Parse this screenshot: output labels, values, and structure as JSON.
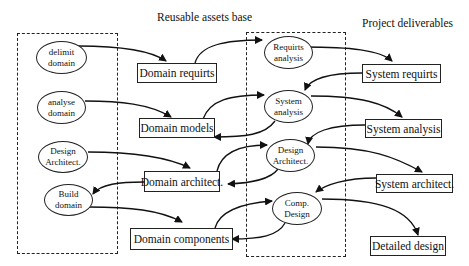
{
  "headers": {
    "reusable": "Reusable assets base",
    "deliverables": "Project deliverables"
  },
  "domain_process": [
    {
      "line1": "delimit",
      "line2": "domain"
    },
    {
      "line1": "analyse",
      "line2": "domain"
    },
    {
      "line1": "Design",
      "line2": "Architect."
    },
    {
      "line1": "Build",
      "line2": "domain"
    }
  ],
  "reusable_assets": [
    {
      "label": "Domain requirts"
    },
    {
      "label": "Domain models"
    },
    {
      "label": "Domain architect."
    },
    {
      "label": "Domain components"
    }
  ],
  "project_process": [
    {
      "line1": "Requirts",
      "line2": "analysis"
    },
    {
      "line1": "System",
      "line2": "analysis"
    },
    {
      "line1": "Design",
      "line2": "Architect."
    },
    {
      "line1": "Comp.",
      "line2": "Design"
    }
  ],
  "deliverables": [
    {
      "label": "System requirts"
    },
    {
      "label": "System analysis"
    },
    {
      "label": "System architect."
    },
    {
      "label": "Detailed design"
    }
  ]
}
